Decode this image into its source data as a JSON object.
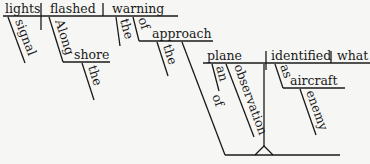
{
  "diagram": {
    "type": "sentence-diagram",
    "words": {
      "subject": "lights",
      "subject_modifier": "signal",
      "verb": "flashed",
      "verb_modifier_prep": "Along",
      "verb_modifier_object": "shore",
      "verb_modifier_object_article": "the",
      "direct_object": "warning",
      "object_article": "the",
      "object_prep": "of",
      "prep_object": "approach",
      "prep_object_article": "the",
      "clause_subject": "plane",
      "clause_article": "an",
      "clause_modifier": "observation",
      "clause_modifier_prep": "of",
      "clause_verb": "identified",
      "clause_object": "what",
      "clause_complement_prep": "as",
      "clause_complement_object": "aircraft",
      "clause_complement_modifier": "enemy"
    }
  }
}
